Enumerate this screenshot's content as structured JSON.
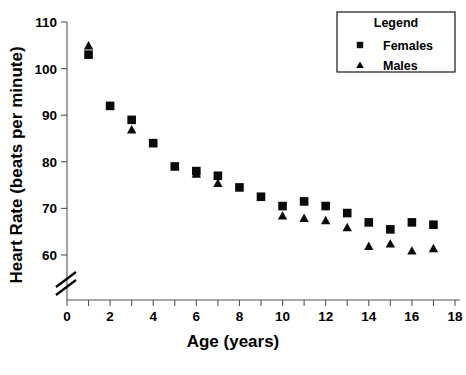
{
  "chart_data": {
    "type": "scatter",
    "title": "",
    "xlabel": "Age (years)",
    "ylabel": "Heart Rate (beats per minute)",
    "xlim": [
      0,
      18
    ],
    "ylim": [
      57,
      111
    ],
    "xticks": [
      0,
      1,
      2,
      3,
      4,
      5,
      6,
      7,
      8,
      9,
      10,
      11,
      12,
      13,
      14,
      15,
      16,
      17,
      18
    ],
    "xticklabels": [
      "0",
      "",
      "2",
      "",
      "4",
      "",
      "6",
      "",
      "8",
      "",
      "10",
      "",
      "12",
      "",
      "14",
      "",
      "16",
      "",
      "18"
    ],
    "yticks": [
      60,
      70,
      80,
      90,
      100,
      110
    ],
    "yticklabels": [
      "60",
      "70",
      "80",
      "90",
      "100",
      "110"
    ],
    "grid": false,
    "axis_break": true,
    "axis_break_note": "y-axis broken below 60",
    "legend": {
      "position": "top-right",
      "title": "Legend",
      "entries": [
        {
          "name": "Females",
          "marker": "square"
        },
        {
          "name": "Males",
          "marker": "triangle"
        }
      ]
    },
    "x": [
      1,
      2,
      3,
      4,
      5,
      6,
      7,
      8,
      9,
      10,
      11,
      12,
      13,
      14,
      15,
      16,
      17
    ],
    "series": [
      {
        "name": "Females",
        "marker": "square",
        "color": "#0a0a0a",
        "values": [
          103,
          92,
          89,
          84,
          79,
          78,
          77,
          74.5,
          72.5,
          70.5,
          71.5,
          70.5,
          69,
          67,
          65.5,
          67,
          66.5
        ]
      },
      {
        "name": "Males",
        "marker": "triangle",
        "color": "#0a0a0a",
        "values": [
          105,
          null,
          87,
          null,
          null,
          77.5,
          75.5,
          null,
          null,
          68.5,
          68,
          67.5,
          66,
          62,
          62.5,
          61,
          61.5
        ]
      }
    ]
  },
  "axis": {
    "x_title": "Age (years)",
    "y_title": "Heart Rate (beats per minute)"
  },
  "legend": {
    "title": "Legend",
    "females_label": "Females",
    "males_label": "Males"
  }
}
